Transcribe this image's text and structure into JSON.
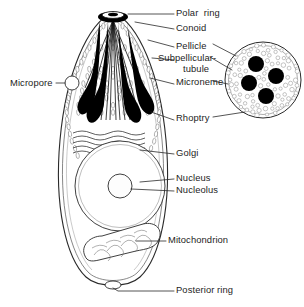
{
  "figure": {
    "background_color": "#ffffff",
    "ink_color": "#1a1a1a",
    "organelle_fill": "#000000"
  },
  "labels": [
    {
      "id": "polar-ring",
      "text": "Polar  ring",
      "x": 176,
      "y": 11,
      "leader": true
    },
    {
      "id": "conoid",
      "text": "Conoid",
      "x": 176,
      "y": 26,
      "leader": true
    },
    {
      "id": "pellicle",
      "text": "Pellicle",
      "x": 176,
      "y": 44,
      "leader": true
    },
    {
      "id": "subpellicular-tubule",
      "text": "Subpellicular-",
      "x": 160,
      "y": 57,
      "leader": true
    },
    {
      "id": "subpellicular-tubule-line2",
      "text": "tubule",
      "x": 184,
      "y": 68,
      "leader": false
    },
    {
      "id": "microneme",
      "text": "Microneme",
      "x": 176,
      "y": 81,
      "leader": true
    },
    {
      "id": "micropore",
      "text": "Micropore",
      "x": 12,
      "y": 80,
      "leader": true
    },
    {
      "id": "rhoptry",
      "text": "Rhoptry",
      "x": 176,
      "y": 117,
      "leader": true
    },
    {
      "id": "golgi",
      "text": "Golgi",
      "x": 176,
      "y": 151,
      "leader": true
    },
    {
      "id": "nucleus",
      "text": "Nucleus",
      "x": 176,
      "y": 176,
      "leader": true
    },
    {
      "id": "nucleolus",
      "text": "Nucleolus",
      "x": 176,
      "y": 188,
      "leader": true
    },
    {
      "id": "mitochondrion",
      "text": "Mitochondrion",
      "x": 168,
      "y": 238,
      "leader": true
    },
    {
      "id": "posterior-ring",
      "text": "Posterior ring",
      "x": 176,
      "y": 288,
      "leader": true
    }
  ],
  "inset": {
    "name": "cross-section-inset",
    "description": "Transverse section showing rhoptries, micronemes and pellicle",
    "center_x": 263,
    "center_y": 80,
    "radius": 38,
    "rhoptry_count": 4,
    "microneme_count": 90
  },
  "cell": {
    "name": "zoite-body",
    "rhoptry_count": 4,
    "golgi_stack_count": 5,
    "nucleus": {
      "cx": 120,
      "cy": 186,
      "r": 45
    },
    "nucleolus": {
      "cx": 120,
      "cy": 186,
      "r": 12
    },
    "micropore": {
      "cx": 72,
      "cy": 83,
      "r": 7
    },
    "posterior_ring": {
      "cx": 113,
      "cy": 285,
      "rx": 8,
      "ry": 4
    }
  }
}
